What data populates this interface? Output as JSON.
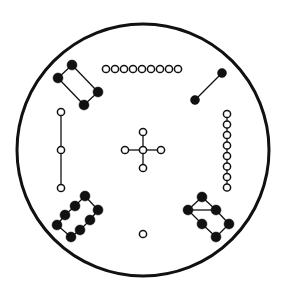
{
  "diagram": {
    "title": "",
    "colors": {
      "stroke": "#111111",
      "fill": "#111111",
      "background": "#ffffff",
      "open_fill": "#ffffff"
    },
    "outer_circle": {
      "cx": 143,
      "cy": 150,
      "r": 126,
      "stroke_width": 3
    },
    "groups": [
      {
        "name": "top-left-filled-rectangle",
        "kind": "filled",
        "r": 5,
        "nodes": [
          [
            72,
            65
          ],
          [
            58,
            78
          ],
          [
            84,
            105
          ],
          [
            98,
            92
          ]
        ],
        "closed": true
      },
      {
        "name": "top-open-row",
        "kind": "open",
        "r": 3.6,
        "nodes": [
          [
            106,
            69
          ],
          [
            115,
            69
          ],
          [
            124,
            69
          ],
          [
            133,
            69
          ],
          [
            142,
            69
          ],
          [
            151,
            69
          ],
          [
            160,
            69
          ],
          [
            169,
            69
          ],
          [
            178,
            69
          ]
        ],
        "closed": false,
        "lines": false
      },
      {
        "name": "top-right-filled-pair",
        "kind": "filled",
        "r": 4.5,
        "nodes": [
          [
            222,
            73
          ],
          [
            195,
            100
          ]
        ],
        "closed": false
      },
      {
        "name": "right-open-column",
        "kind": "open",
        "r": 3.6,
        "nodes": [
          [
            227,
            114
          ],
          [
            227,
            124.5
          ],
          [
            227,
            135
          ],
          [
            227,
            145.5
          ],
          [
            227,
            156
          ],
          [
            227,
            166.5
          ],
          [
            227,
            177
          ],
          [
            227,
            187.5
          ]
        ],
        "closed": false
      },
      {
        "name": "left-open-vertical",
        "kind": "open",
        "r": 3.6,
        "nodes": [
          [
            61,
            112
          ],
          [
            61,
            150
          ],
          [
            61,
            188
          ]
        ],
        "closed": false
      },
      {
        "name": "center-cross-hub",
        "kind": "open",
        "r": 3.6,
        "nodes": [
          [
            143,
            150
          ]
        ],
        "closed": false,
        "spokes": [
          [
            143,
            132
          ],
          [
            161,
            150
          ],
          [
            143,
            168
          ],
          [
            125,
            150
          ]
        ]
      },
      {
        "name": "bottom-left-filled-rectangle",
        "kind": "filled",
        "r": 5,
        "nodes": [
          [
            85,
            196
          ],
          [
            75,
            206
          ],
          [
            65,
            215
          ],
          [
            57,
            225
          ],
          [
            71,
            237
          ],
          [
            80,
            230
          ],
          [
            90,
            220
          ],
          [
            98,
            210
          ]
        ],
        "closed": true
      },
      {
        "name": "bottom-right-filled-rectangle",
        "kind": "filled",
        "r": 5,
        "nodes": [
          [
            202,
            197
          ],
          [
            188,
            210
          ],
          [
            202,
            224
          ],
          [
            216,
            237
          ],
          [
            229,
            224
          ],
          [
            216,
            210
          ]
        ],
        "closed": true,
        "extra_edges": [
          [
            [
              188,
              210
            ],
            [
              216,
              210
            ]
          ]
        ]
      },
      {
        "name": "bottom-center-open-node",
        "kind": "open",
        "r": 3.6,
        "nodes": [
          [
            143,
            234
          ]
        ],
        "closed": false
      }
    ]
  }
}
